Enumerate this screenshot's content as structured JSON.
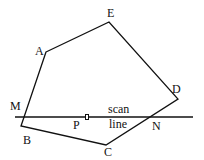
{
  "diagram": {
    "vertices": [
      {
        "name": "A",
        "x": 46,
        "y": 52,
        "lx": 35,
        "ly": 55
      },
      {
        "name": "E",
        "x": 109,
        "y": 22,
        "lx": 107,
        "ly": 17
      },
      {
        "name": "D",
        "x": 178,
        "y": 99,
        "lx": 172,
        "ly": 93
      },
      {
        "name": "C",
        "x": 106,
        "y": 145,
        "lx": 104,
        "ly": 156
      },
      {
        "name": "B",
        "x": 21,
        "y": 126,
        "lx": 23,
        "ly": 144
      }
    ],
    "intersections": [
      {
        "name": "M",
        "x": 23,
        "y": 117,
        "lx": 10,
        "ly": 110
      },
      {
        "name": "N",
        "x": 150,
        "y": 117,
        "lx": 152,
        "ly": 130
      }
    ],
    "point_p": {
      "label": "P",
      "x": 87,
      "y": 117,
      "lx": 73,
      "ly": 129
    },
    "scan_line": {
      "x1": 15,
      "x2": 193,
      "y": 117,
      "label_1": "scan",
      "label_2": "line"
    }
  }
}
